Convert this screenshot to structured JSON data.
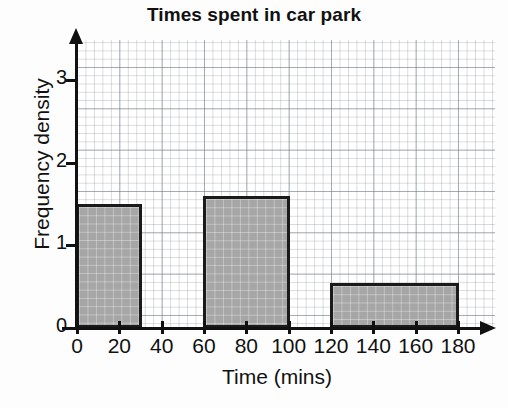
{
  "chart_data": {
    "type": "bar",
    "title": "Times spent in car park",
    "subtitle": "",
    "xlabel": "Time (mins)",
    "ylabel": "Frequency density",
    "xlim": [
      0,
      190
    ],
    "ylim": [
      0,
      3.45
    ],
    "grid": true,
    "grid_major_step_x": 20,
    "grid_major_step_y": 0.5,
    "grid_minor_step_x": 4,
    "grid_minor_step_y": 0.1,
    "legend": "none",
    "xticks": [
      0,
      20,
      40,
      60,
      80,
      100,
      120,
      140,
      160,
      180
    ],
    "xtick_labels": [
      "0",
      "20",
      "40",
      "60",
      "80",
      "100",
      "120",
      "140",
      "160",
      "180"
    ],
    "yticks": [
      0,
      1,
      2,
      3
    ],
    "ytick_labels": [
      "0",
      "1",
      "2",
      "3"
    ],
    "bars": [
      {
        "label": "0-30",
        "x_start": 0,
        "x_end": 30,
        "value": 1.5,
        "frequency": 45
      },
      {
        "label": "60-100",
        "x_start": 60,
        "x_end": 100,
        "value": 1.6,
        "frequency": 64
      },
      {
        "label": "120-180",
        "x_start": 120,
        "x_end": 180,
        "value": 0.55,
        "frequency": 33
      }
    ],
    "bar_fill_color": "#a6a6a6",
    "bar_edge_color": "#1a1a1a",
    "grid_color": "#7a828c",
    "axis_color": "#111111",
    "background_color": "#ffffff"
  }
}
